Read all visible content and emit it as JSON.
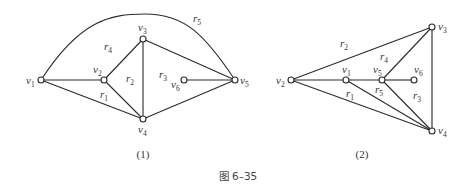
{
  "figure_caption": "图 6–35",
  "graphs": [
    {
      "caption": "(1)",
      "vertices": [
        {
          "id": "v1",
          "base": "v",
          "sub": "1",
          "x": 41,
          "y": 80,
          "lx": 26,
          "ly": 84
        },
        {
          "id": "v2",
          "base": "v",
          "sub": "2",
          "x": 104,
          "y": 80,
          "lx": 93,
          "ly": 73
        },
        {
          "id": "v3",
          "base": "v",
          "sub": "3",
          "x": 143,
          "y": 39,
          "lx": 138,
          "ly": 31
        },
        {
          "id": "v4",
          "base": "v",
          "sub": "4",
          "x": 143,
          "y": 119,
          "lx": 138,
          "ly": 133
        },
        {
          "id": "v5",
          "base": "v",
          "sub": "5",
          "x": 235,
          "y": 80,
          "lx": 240,
          "ly": 84
        },
        {
          "id": "v6",
          "base": "v",
          "sub": "6",
          "x": 184,
          "y": 80,
          "lx": 171,
          "ly": 88
        }
      ],
      "edges": [
        [
          "v1",
          "v2"
        ],
        [
          "v1",
          "v4"
        ],
        [
          "v2",
          "v3"
        ],
        [
          "v2",
          "v4"
        ],
        [
          "v3",
          "v4"
        ],
        [
          "v3",
          "v5"
        ],
        [
          "v4",
          "v5"
        ],
        [
          "v6",
          "v5"
        ]
      ],
      "arcs": [
        {
          "from": "v1",
          "to": "v5",
          "path": "M41,80 C80,20 110,14 145,14 C185,14 205,35 235,80"
        }
      ],
      "faces": [
        {
          "base": "r",
          "sub": "1",
          "x": 100,
          "y": 98
        },
        {
          "base": "r",
          "sub": "2",
          "x": 126,
          "y": 82
        },
        {
          "base": "r",
          "sub": "3",
          "x": 159,
          "y": 78
        },
        {
          "base": "r",
          "sub": "4",
          "x": 104,
          "y": 50
        },
        {
          "base": "r",
          "sub": "5",
          "x": 193,
          "y": 22
        }
      ],
      "caption_pos": {
        "x": 143,
        "y": 158
      }
    },
    {
      "caption": "(2)",
      "vertices": [
        {
          "id": "v2",
          "base": "v",
          "sub": "2",
          "x": 291,
          "y": 80,
          "lx": 276,
          "ly": 84
        },
        {
          "id": "v1",
          "base": "v",
          "sub": "1",
          "x": 346,
          "y": 80,
          "lx": 342,
          "ly": 73
        },
        {
          "id": "v5",
          "base": "v",
          "sub": "5",
          "x": 382,
          "y": 80,
          "lx": 373,
          "ly": 73
        },
        {
          "id": "v6",
          "base": "v",
          "sub": "6",
          "x": 414,
          "y": 80,
          "lx": 414,
          "ly": 73
        },
        {
          "id": "v3",
          "base": "v",
          "sub": "3",
          "x": 432,
          "y": 27,
          "lx": 438,
          "ly": 30
        },
        {
          "id": "v4",
          "base": "v",
          "sub": "4",
          "x": 432,
          "y": 131,
          "lx": 438,
          "ly": 134
        }
      ],
      "edges": [
        [
          "v2",
          "v3"
        ],
        [
          "v2",
          "v1"
        ],
        [
          "v1",
          "v5"
        ],
        [
          "v5",
          "v6"
        ],
        [
          "v2",
          "v4"
        ],
        [
          "v1",
          "v4"
        ],
        [
          "v5",
          "v4"
        ],
        [
          "v5",
          "v3"
        ],
        [
          "v3",
          "v4"
        ]
      ],
      "arcs": [],
      "faces": [
        {
          "base": "r",
          "sub": "1",
          "x": 346,
          "y": 97
        },
        {
          "base": "r",
          "sub": "2",
          "x": 340,
          "y": 47
        },
        {
          "base": "r",
          "sub": "3",
          "x": 413,
          "y": 99
        },
        {
          "base": "r",
          "sub": "4",
          "x": 380,
          "y": 60
        },
        {
          "base": "r",
          "sub": "5",
          "x": 375,
          "y": 93
        }
      ],
      "caption_pos": {
        "x": 362,
        "y": 158
      }
    }
  ],
  "figure_caption_pos": {
    "x": 238,
    "y": 180
  }
}
